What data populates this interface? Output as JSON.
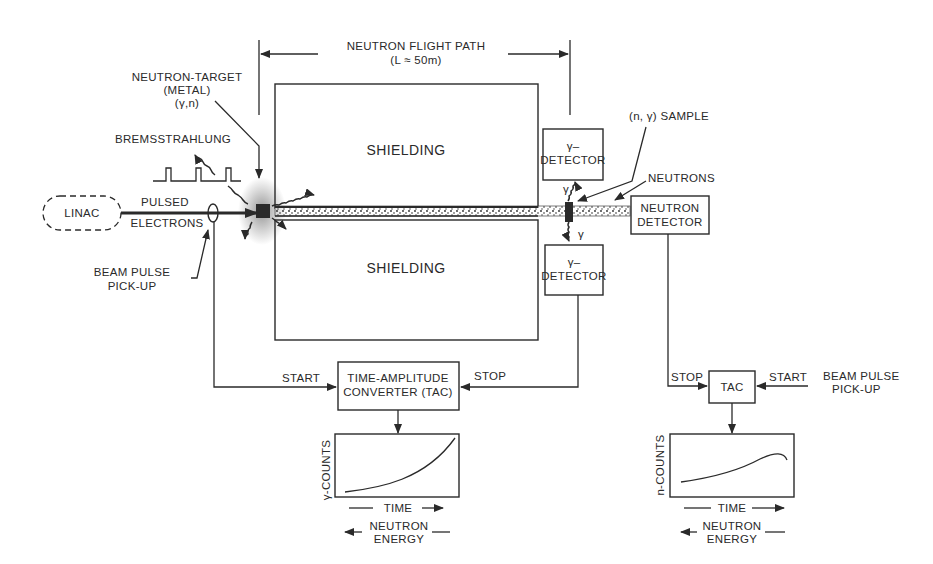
{
  "flight_path": {
    "title": "NEUTRON FLIGHT PATH",
    "subtitle": "(L ≈ 50m)"
  },
  "neutron_target": {
    "line1": "NEUTRON-TARGET",
    "line2": "(METAL)",
    "line3": "(γ,n)"
  },
  "bremsstrahlung": "BREMSSTRAHLUNG",
  "linac": "LINAC",
  "pulsed_electrons": {
    "line1": "PULSED",
    "line2": "ELECTRONS"
  },
  "beam_pickup_left": {
    "line1": "BEAM PULSE",
    "line2": "PICK-UP"
  },
  "shielding_top": "SHIELDING",
  "shielding_bottom": "SHIELDING",
  "sample_label": "(n, γ) SAMPLE",
  "neutrons_label": "NEUTRONS",
  "gamma_symbol": "γ",
  "gamma_detector_top": {
    "line1": "γ–",
    "line2": "DETECTOR"
  },
  "gamma_detector_bottom": {
    "line1": "γ–",
    "line2": "DETECTOR"
  },
  "neutron_detector": {
    "line1": "NEUTRON",
    "line2": "DETECTOR"
  },
  "tac_main": {
    "line1": "TIME-AMPLITUDE",
    "line2": "CONVERTER (TAC)",
    "start": "START",
    "stop": "STOP"
  },
  "tac_right": {
    "label": "TAC",
    "start": "START",
    "stop": "STOP"
  },
  "beam_pickup_right": {
    "line1": "BEAM PULSE",
    "line2": "PICK-UP"
  },
  "plot_left": {
    "ylabel": "γ-COUNTS",
    "xlabel": "TIME",
    "energy_line1": "NEUTRON",
    "energy_line2": "ENERGY"
  },
  "plot_right": {
    "ylabel": "n-COUNTS",
    "xlabel": "TIME",
    "energy_line1": "NEUTRON",
    "energy_line2": "ENERGY"
  },
  "colors": {
    "ink": "#2a2a2a",
    "background": "#ffffff"
  }
}
